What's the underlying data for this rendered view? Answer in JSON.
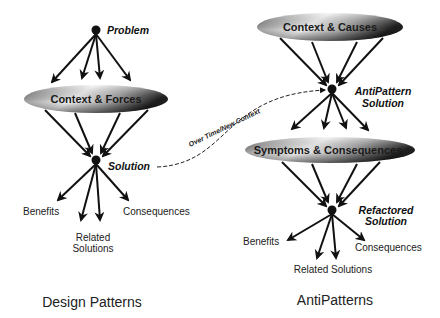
{
  "diagram": {
    "left": {
      "title": "Design Patterns",
      "problem_label": "Problem",
      "ellipse_label": "Context & Forces",
      "solution_label": "Solution",
      "outcomes": {
        "benefits": "Benefits",
        "related_line1": "Related",
        "related_line2": "Solutions",
        "consequences": "Consequences"
      }
    },
    "right": {
      "title": "AntiPatterns",
      "top_ellipse_label": "Context & Causes",
      "antipattern_label_line1": "AntiPattern",
      "antipattern_label_line2": "Solution",
      "mid_ellipse_label": "Symptoms & Consequences",
      "refactored_label_line1": "Refactored",
      "refactored_label_line2": "Solution",
      "outcomes": {
        "benefits": "Benefits",
        "related": "Related Solutions",
        "consequences": "Consequences"
      }
    },
    "connector_label": "Over Time/New Context",
    "colors": {
      "stroke": "#111111",
      "ellipse_light": "#f2f2f2",
      "ellipse_dark": "#2a2a2a"
    }
  }
}
